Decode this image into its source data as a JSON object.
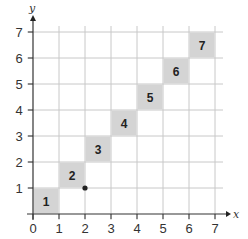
{
  "chart_data": {
    "type": "scatter",
    "title": "",
    "xlabel": "x",
    "ylabel": "y",
    "xlim": [
      0,
      7
    ],
    "ylim": [
      0,
      7
    ],
    "grid": true,
    "x_ticks": [
      "0",
      "1",
      "2",
      "3",
      "4",
      "5",
      "6",
      "7"
    ],
    "y_ticks": [
      "1",
      "2",
      "3",
      "4",
      "5",
      "6",
      "7"
    ],
    "shaded_squares": [
      {
        "label": "1",
        "x": 0,
        "y": 0
      },
      {
        "label": "2",
        "x": 1,
        "y": 1
      },
      {
        "label": "3",
        "x": 2,
        "y": 2
      },
      {
        "label": "4",
        "x": 3,
        "y": 3
      },
      {
        "label": "5",
        "x": 4,
        "y": 4
      },
      {
        "label": "6",
        "x": 5,
        "y": 5
      },
      {
        "label": "7",
        "x": 6,
        "y": 6
      }
    ],
    "points": [
      {
        "x": 2,
        "y": 1
      }
    ],
    "colors": {
      "square_fill": "#d4d4d4",
      "grid": "#c8c8c8",
      "axis": "#333333"
    }
  }
}
